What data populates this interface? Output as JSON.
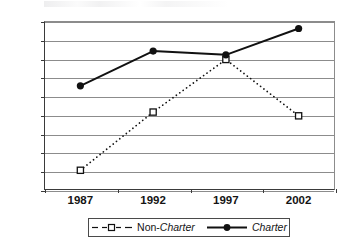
{
  "chart_data": {
    "type": "line",
    "title": "",
    "subtitle": "",
    "xlabel": "",
    "ylabel": "",
    "categories": [
      "1987",
      "1992",
      "1997",
      "2002"
    ],
    "ylim": [
      0,
      0.18
    ],
    "yticks": [
      "0",
      "0.02",
      "0.04",
      "0.06",
      "0.08",
      "0.1",
      "0.12",
      "0.14",
      "0.16",
      "0.18"
    ],
    "ytick_values": [
      0,
      0.02,
      0.04,
      0.06,
      0.08,
      0.1,
      0.12,
      0.14,
      0.16,
      0.18
    ],
    "grid": "horizontal",
    "legend_position": "bottom",
    "series": [
      {
        "name": "Non-Charter",
        "name_plain": "Non-",
        "name_italic": "Charter",
        "values": [
          0.021,
          0.083,
          0.139,
          0.079
        ],
        "line_style": "dotted",
        "marker": "open-square",
        "color": "#111111"
      },
      {
        "name": "Charter",
        "name_plain": "",
        "name_italic": "Charter",
        "values": [
          0.111,
          0.148,
          0.144,
          0.172
        ],
        "line_style": "solid",
        "marker": "filled-circle",
        "color": "#111111"
      }
    ]
  },
  "axes": {
    "y_labels": [
      "0.18",
      "0.16",
      "0.14",
      "0.12",
      "0.1",
      "0.08",
      "0.06",
      "0.04",
      "0.02",
      "0"
    ],
    "x_labels": [
      "1987",
      "1992",
      "1997",
      "2002"
    ]
  },
  "legend": {
    "items": [
      {
        "label_plain": "Non-",
        "label_italic": "Charter",
        "key": "dotted-open-square-key"
      },
      {
        "label_plain": "",
        "label_italic": "Charter",
        "key": "solid-filled-circle-key"
      }
    ]
  },
  "colors": {
    "ink": "#111111",
    "gridline": "#8c8c8c",
    "axis": "#3a3a3a",
    "background": "#ffffff"
  }
}
